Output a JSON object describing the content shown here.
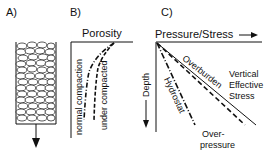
{
  "panels": {
    "a": {
      "label": "A)"
    },
    "b": {
      "label": "B)",
      "axis_title": "Porosity",
      "curves": [
        {
          "name": "normal compaction",
          "style": "dash-dot"
        },
        {
          "name": "under compacted",
          "style": "dashed"
        }
      ]
    },
    "c": {
      "label": "C)",
      "x_axis_title": "Pressure/Stress",
      "y_axis_title": "Depth",
      "lines": [
        {
          "name": "Overburden",
          "style": "solid"
        },
        {
          "name": "Hydrostat",
          "style": "dash-dot"
        },
        {
          "name": "Over-pressure",
          "style": "dashed"
        }
      ],
      "annotation_1": "Vertical",
      "annotation_2": "Effective",
      "annotation_3": "Stress",
      "overpressure_1": "Over-",
      "overpressure_2": "pressure"
    }
  }
}
